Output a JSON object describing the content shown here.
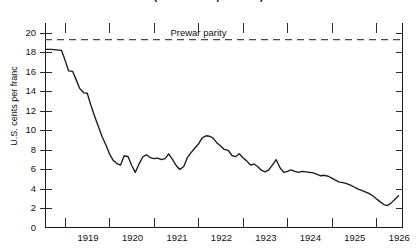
{
  "chart_data": {
    "type": "line",
    "title": "(U.S. dollars per franc)",
    "xlabel": "",
    "ylabel": "U.S. cents per franc",
    "ylim": [
      0,
      21
    ],
    "xlim": [
      1918.55,
      1926.6
    ],
    "yticks": [
      0,
      2,
      4,
      6,
      8,
      10,
      12,
      14,
      16,
      18,
      20
    ],
    "ytick_labels": [
      "0",
      "2",
      "4",
      "6",
      "8",
      "10",
      "12",
      "14",
      "16",
      "18",
      "20"
    ],
    "xticks": [
      1919,
      1920,
      1921,
      1922,
      1923,
      1924,
      1925,
      1926
    ],
    "xtick_labels": [
      "1919",
      "1920",
      "1921",
      "1922",
      "1923",
      "1924",
      "1925",
      "1926"
    ],
    "grid": false,
    "legend": "none",
    "annotations": [
      {
        "name": "prewar-parity",
        "label": "Prewar parity",
        "type": "horizontal-dashed-line",
        "y": 19.3,
        "color": "#444444"
      }
    ],
    "series": [
      {
        "name": "French franc exchange rate",
        "color": "#1a1a1a",
        "x": [
          1918.58,
          1918.7,
          1918.8,
          1918.92,
          1919.0,
          1919.08,
          1919.17,
          1919.25,
          1919.33,
          1919.42,
          1919.5,
          1919.58,
          1919.67,
          1919.75,
          1919.83,
          1919.92,
          1920.0,
          1920.08,
          1920.17,
          1920.25,
          1920.33,
          1920.42,
          1920.5,
          1920.58,
          1920.67,
          1920.75,
          1920.83,
          1920.92,
          1921.0,
          1921.08,
          1921.17,
          1921.25,
          1921.33,
          1921.42,
          1921.5,
          1921.58,
          1921.67,
          1921.75,
          1921.83,
          1921.92,
          1922.0,
          1922.08,
          1922.17,
          1922.25,
          1922.33,
          1922.42,
          1922.5,
          1922.58,
          1922.67,
          1922.75,
          1922.83,
          1922.92,
          1923.0,
          1923.08,
          1923.17,
          1923.25,
          1923.33,
          1923.42,
          1923.5,
          1923.58,
          1923.67,
          1923.75,
          1923.83,
          1923.92,
          1924.0,
          1924.08,
          1924.17,
          1924.25,
          1924.33,
          1924.42,
          1924.5,
          1924.58,
          1924.67,
          1924.75,
          1924.83,
          1924.92,
          1925.0,
          1925.08,
          1925.17,
          1925.25,
          1925.33,
          1925.42,
          1925.5,
          1925.58,
          1925.67,
          1925.75,
          1925.83,
          1925.92,
          1926.0,
          1926.08,
          1926.17,
          1926.25,
          1926.33,
          1926.42,
          1926.5
        ],
        "y": [
          18.3,
          18.3,
          18.25,
          18.2,
          17.2,
          16.1,
          16.05,
          15.2,
          14.3,
          13.85,
          13.8,
          12.6,
          11.4,
          10.4,
          9.4,
          8.5,
          7.6,
          6.95,
          6.6,
          6.45,
          7.4,
          7.3,
          6.4,
          5.7,
          6.6,
          7.3,
          7.5,
          7.2,
          7.1,
          7.15,
          7.0,
          7.1,
          7.6,
          7.0,
          6.4,
          6.0,
          6.3,
          7.2,
          7.7,
          8.2,
          8.6,
          9.2,
          9.45,
          9.4,
          9.2,
          8.7,
          8.4,
          8.05,
          7.95,
          7.45,
          7.3,
          7.6,
          7.2,
          6.9,
          6.45,
          6.55,
          6.3,
          5.9,
          5.75,
          5.95,
          6.5,
          7.0,
          6.2,
          5.7,
          5.8,
          5.95,
          5.8,
          5.7,
          5.8,
          5.75,
          5.7,
          5.65,
          5.5,
          5.35,
          5.4,
          5.3,
          5.1,
          4.9,
          4.7,
          4.65,
          4.55,
          4.4,
          4.2,
          4.0,
          3.85,
          3.7,
          3.55,
          3.3,
          3.0,
          2.7,
          2.4,
          2.3,
          2.55,
          2.95,
          3.3
        ]
      }
    ]
  }
}
